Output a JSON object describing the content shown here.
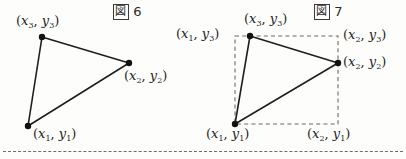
{
  "page": {
    "background_color": "#fdfdfc",
    "ink_color": "#1b1b1b",
    "width": 406,
    "height": 159
  },
  "figures": [
    {
      "id": "figure-6",
      "caption_symbol": "図",
      "caption_number": "6",
      "caption_text": "図 6",
      "description": "triangle with three labelled vertices",
      "has_bounding_box": false,
      "vertices": [
        {
          "name": "v3",
          "label": "(x3, y3)",
          "x": 42,
          "y": 37
        },
        {
          "name": "v2",
          "label": "(x2, y2)",
          "x": 129,
          "y": 63
        },
        {
          "name": "v1",
          "label": "(x1, y1)",
          "x": 28,
          "y": 126
        }
      ],
      "labels": [
        {
          "name": "label-x3-y3",
          "x_var": "x",
          "x_sub": "3",
          "y_var": "y",
          "y_sub": "3",
          "x": 16,
          "y": 13
        },
        {
          "name": "label-x2-y2",
          "x_var": "x",
          "x_sub": "2",
          "y_var": "y",
          "y_sub": "2",
          "x": 124,
          "y": 68
        },
        {
          "name": "label-x1-y1",
          "x_var": "x",
          "x_sub": "1",
          "y_var": "y",
          "y_sub": "1",
          "x": 33,
          "y": 126
        }
      ]
    },
    {
      "id": "figure-7",
      "caption_symbol": "図",
      "caption_number": "7",
      "caption_text": "図 7",
      "description": "same triangle enclosed in a dashed axis-aligned bounding box with corner labels",
      "has_bounding_box": true,
      "bounding_box": {
        "left": 235,
        "top": 36,
        "right": 338,
        "bottom": 124
      },
      "vertices": [
        {
          "name": "v3",
          "label": "(x3, y3)",
          "x": 250,
          "y": 36
        },
        {
          "name": "v2",
          "label": "(x2, y2)",
          "x": 338,
          "y": 63
        },
        {
          "name": "v1",
          "label": "(x1, y1)",
          "x": 235,
          "y": 124
        }
      ],
      "labels": [
        {
          "name": "label-x3-y3",
          "x_var": "x",
          "x_sub": "3",
          "y_var": "y",
          "y_sub": "3",
          "x": 244,
          "y": 11
        },
        {
          "name": "label-x1-y3",
          "x_var": "x",
          "x_sub": "1",
          "y_var": "y",
          "y_sub": "3",
          "x": 176,
          "y": 26
        },
        {
          "name": "label-x2-y3",
          "x_var": "x",
          "x_sub": "2",
          "y_var": "y",
          "y_sub": "3",
          "x": 343,
          "y": 27
        },
        {
          "name": "label-x2-y2",
          "x_var": "x",
          "x_sub": "2",
          "y_var": "y",
          "y_sub": "2",
          "x": 343,
          "y": 54
        },
        {
          "name": "label-x1-y1",
          "x_var": "x",
          "x_sub": "1",
          "y_var": "y",
          "y_sub": "1",
          "x": 206,
          "y": 126
        },
        {
          "name": "label-x2-y1",
          "x_var": "x",
          "x_sub": "2",
          "y_var": "y",
          "y_sub": "1",
          "x": 307,
          "y": 126
        }
      ]
    }
  ],
  "captions": [
    {
      "name": "figure-6-caption",
      "symbol": "図",
      "number": "6",
      "x": 113,
      "y": 4
    },
    {
      "name": "figure-7-caption",
      "symbol": "図",
      "number": "7",
      "x": 314,
      "y": 4
    }
  ],
  "divider": {
    "name": "page-divider",
    "style": "dashed",
    "y": 151
  }
}
